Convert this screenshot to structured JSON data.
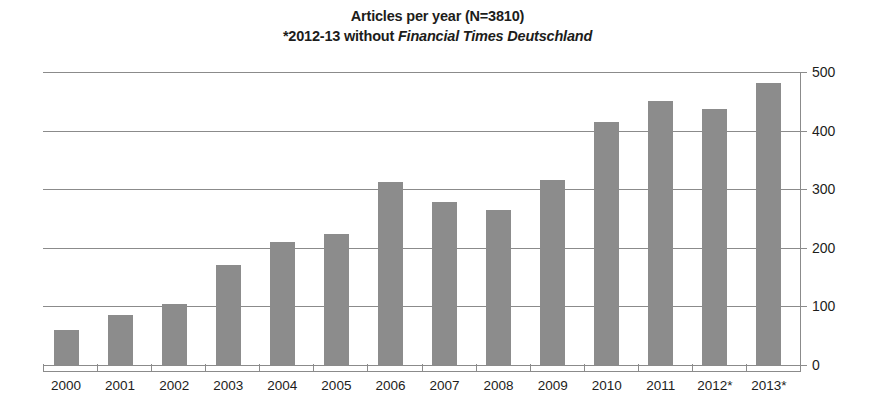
{
  "chart_data": {
    "type": "bar",
    "title": "Articles per year (N=3810)",
    "subtitle_prefix": "*2012-13 without ",
    "subtitle_emphasis": "Financial Times Deutschland",
    "xlabel": "",
    "ylabel": "",
    "ylim": [
      0,
      500
    ],
    "yticks": [
      0,
      100,
      200,
      300,
      400,
      500
    ],
    "ytick_labels": [
      "0",
      "100",
      "200",
      "300",
      "400",
      "500"
    ],
    "y_axis_position": "right",
    "grid": "horizontal",
    "legend": "none",
    "bar_color": "#8c8c8c",
    "total_n": 3810,
    "categories": [
      "2000",
      "2001",
      "2002",
      "2003",
      "2004",
      "2005",
      "2006",
      "2007",
      "2008",
      "2009",
      "2010",
      "2011",
      "2012*",
      "2013*"
    ],
    "values": [
      59,
      85,
      104,
      170,
      210,
      224,
      312,
      278,
      264,
      315,
      415,
      451,
      437,
      481
    ],
    "annotations": [
      "* 2012-13 without Financial Times Deutschland"
    ]
  }
}
